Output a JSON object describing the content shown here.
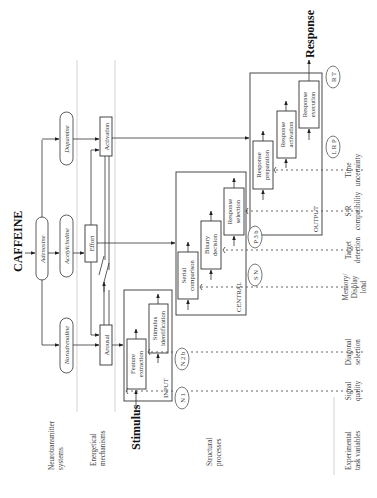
{
  "title": "CAFFEINE",
  "stimulus_label": "Stimulus",
  "response_label": "Response",
  "neurotransmitters": {
    "dopamine": "Dopamine",
    "adenosine": "Adenosine",
    "acetylcholine": "Acetylcholine",
    "noradrenaline": "Noradrenaline"
  },
  "energetical": {
    "activation": "Activation",
    "effort": "Effort",
    "arousal": "Arousal"
  },
  "stages": {
    "input": {
      "label": "INPUT",
      "boxes": [
        {
          "line1": "Feature",
          "line2": "extraction"
        },
        {
          "line1": "Stimulus",
          "line2": "identification"
        }
      ]
    },
    "central": {
      "label": "CENTRAL",
      "boxes": [
        {
          "line1": "Serial",
          "line2": "comparison"
        },
        {
          "line1": "Binary",
          "line2": "decision"
        },
        {
          "line1": "Response",
          "line2": "selection"
        }
      ]
    },
    "output": {
      "label": "OUTPUT",
      "boxes": [
        {
          "line1": "Response",
          "line2": "preparation"
        },
        {
          "line1": "Response",
          "line2": "activation"
        },
        {
          "line1": "Response",
          "line2": "execution"
        }
      ]
    }
  },
  "erp_markers": [
    "N 1",
    "N 2 b",
    "S N",
    "P 3 b",
    "L R P",
    "R T"
  ],
  "row_labels": {
    "neurotransmitter": {
      "line1": "Neurotransmitter",
      "line2": "systems"
    },
    "energetical": {
      "line1": "Energetical",
      "line2": "mechanisms"
    },
    "structural": {
      "line1": "Structural",
      "line2": "processes"
    },
    "task_variables": {
      "line1": "Experimental",
      "line2": "task variables"
    }
  },
  "task_variables": [
    {
      "line1": "Signal",
      "line2": "quality",
      "line3": ""
    },
    {
      "line1": "Diagonal",
      "line2": "selection",
      "line3": ""
    },
    {
      "line1": "Memory/",
      "line2": "Display",
      "line3": "load"
    },
    {
      "line1": "Target",
      "line2": "detection",
      "line3": ""
    },
    {
      "line1": "S-R",
      "line2": "compatibility",
      "line3": ""
    },
    {
      "line1": "Time",
      "line2": "uncertainty",
      "line3": ""
    }
  ]
}
